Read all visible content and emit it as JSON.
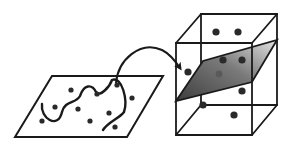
{
  "diagram": {
    "colors": {
      "stroke": "#1a1a1a",
      "dot": "#2a2a2a",
      "plane_light": "#d6d6d6",
      "plane_dark": "#4a4a4a",
      "background": "#ffffff"
    },
    "input_space": {
      "shape": "parallelogram",
      "points": [
        [
          15,
          137
        ],
        [
          52,
          76
        ],
        [
          163,
          76
        ],
        [
          127,
          137
        ]
      ],
      "dots": [
        [
          71,
          90
        ],
        [
          97,
          94
        ],
        [
          117,
          85
        ],
        [
          132,
          98
        ],
        [
          55,
          107
        ],
        [
          78,
          109
        ],
        [
          109,
          113
        ],
        [
          42,
          121
        ],
        [
          90,
          121
        ],
        [
          115,
          127
        ]
      ],
      "boundary_curve": "M42,104 C40,118 58,130 62,112 C65,100 76,104 80,96 C84,84 92,84 96,92 C100,98 110,86 112,80 C122,76 128,100 124,112 C120,118 108,122 103,130"
    },
    "mapping_arrow": {
      "path": "M116,83 C118,60 140,40 162,50 C170,54 176,62 180,68"
    },
    "feature_space": {
      "shape": "cube",
      "front": [
        [
          176,
          43
        ],
        [
          252,
          43
        ],
        [
          252,
          135
        ],
        [
          176,
          135
        ]
      ],
      "back": [
        [
          201,
          14
        ],
        [
          277,
          14
        ],
        [
          277,
          105
        ],
        [
          201,
          105
        ]
      ],
      "plane": [
        [
          176,
          101
        ],
        [
          203,
          61
        ],
        [
          277,
          40
        ],
        [
          252,
          82
        ]
      ],
      "dots_above": [
        [
          216,
          32
        ],
        [
          238,
          32
        ],
        [
          188,
          72
        ],
        [
          223,
          60
        ],
        [
          242,
          60
        ]
      ],
      "dots_on_plane": [
        [
          219,
          74
        ]
      ],
      "dots_below": [
        [
          242,
          91
        ],
        [
          203,
          105
        ],
        [
          234,
          115
        ]
      ]
    }
  }
}
